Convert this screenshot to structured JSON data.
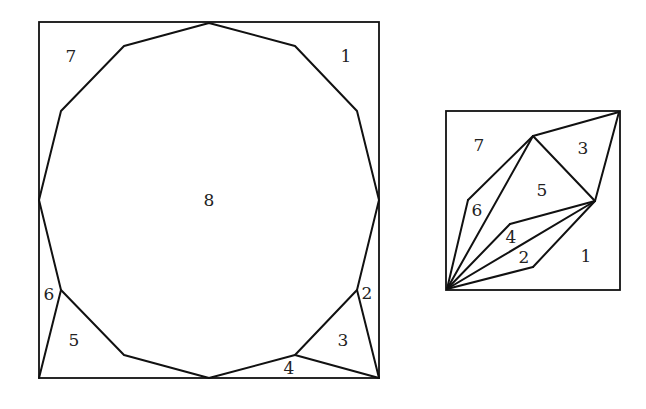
{
  "left_figure": {
    "name": "dodecagon-in-square",
    "square": {
      "x1": 39,
      "y1": 22,
      "x2": 379,
      "y2": 378
    },
    "polygon": [
      [
        209,
        23
      ],
      [
        295,
        46
      ],
      [
        357,
        111
      ],
      [
        379,
        200
      ],
      [
        357,
        290
      ],
      [
        295,
        355
      ],
      [
        209,
        378
      ],
      [
        124,
        355
      ],
      [
        61,
        290
      ],
      [
        39,
        200
      ],
      [
        61,
        111
      ],
      [
        124,
        46
      ]
    ],
    "extra_edges": [
      [
        [
          39,
          378
        ],
        [
          61,
          290
        ]
      ],
      [
        [
          357,
          290
        ],
        [
          379,
          378
        ]
      ],
      [
        [
          295,
          355
        ],
        [
          379,
          378
        ]
      ]
    ],
    "labels": [
      {
        "id": "1",
        "text": "1",
        "x": 346,
        "y": 56
      },
      {
        "id": "2",
        "text": "2",
        "x": 367,
        "y": 293
      },
      {
        "id": "3",
        "text": "3",
        "x": 343,
        "y": 340
      },
      {
        "id": "4",
        "text": "4",
        "x": 289,
        "y": 368
      },
      {
        "id": "5",
        "text": "5",
        "x": 74,
        "y": 340
      },
      {
        "id": "6",
        "text": "6",
        "x": 49,
        "y": 294
      },
      {
        "id": "7",
        "text": "7",
        "x": 71,
        "y": 56
      },
      {
        "id": "8",
        "text": "8",
        "x": 209,
        "y": 200
      }
    ]
  },
  "right_figure": {
    "name": "rearranged-pieces-in-square",
    "square": {
      "x1": 446,
      "y1": 111,
      "x2": 620,
      "y2": 290
    },
    "edges": [
      [
        [
          447,
          289
        ],
        [
          468,
          200
        ]
      ],
      [
        [
          468,
          200
        ],
        [
          533,
          136
        ]
      ],
      [
        [
          447,
          289
        ],
        [
          533,
          136
        ]
      ],
      [
        [
          533,
          136
        ],
        [
          619,
          112
        ]
      ],
      [
        [
          533,
          136
        ],
        [
          595,
          201
        ]
      ],
      [
        [
          619,
          112
        ],
        [
          595,
          201
        ]
      ],
      [
        [
          447,
          289
        ],
        [
          510,
          224
        ]
      ],
      [
        [
          510,
          224
        ],
        [
          595,
          201
        ]
      ],
      [
        [
          447,
          289
        ],
        [
          595,
          201
        ]
      ],
      [
        [
          447,
          289
        ],
        [
          533,
          267
        ]
      ],
      [
        [
          533,
          267
        ],
        [
          595,
          201
        ]
      ]
    ],
    "labels": [
      {
        "id": "1",
        "text": "1",
        "x": 586,
        "y": 256
      },
      {
        "id": "2",
        "text": "2",
        "x": 524,
        "y": 257
      },
      {
        "id": "3",
        "text": "3",
        "x": 583,
        "y": 148
      },
      {
        "id": "4",
        "text": "4",
        "x": 511,
        "y": 237
      },
      {
        "id": "5",
        "text": "5",
        "x": 542,
        "y": 190
      },
      {
        "id": "6",
        "text": "6",
        "x": 477,
        "y": 210
      },
      {
        "id": "7",
        "text": "7",
        "x": 479,
        "y": 145
      }
    ]
  },
  "colors": {
    "stroke": "#111111",
    "text": "#222222",
    "background": "#ffffff"
  }
}
